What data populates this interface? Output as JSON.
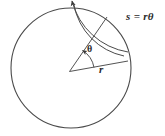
{
  "figure": {
    "kind": "geometry-diagram",
    "background_color": "#ffffff",
    "stroke_color": "#3a3a3a",
    "text_color": "#2b2b2b",
    "labels": {
      "arc_equation": "s = rθ",
      "angle": "θ",
      "radius": "r"
    },
    "geometry": {
      "circle": {
        "center_x": 71,
        "center_y": 68,
        "radius": 60
      },
      "angle_arc": {
        "radius": 20,
        "start_angle_deg": 0,
        "end_angle_deg": 52
      },
      "outer_arc": {
        "radius": 66,
        "start_angle_deg": 52,
        "end_angle_deg": 92
      },
      "radius_lines": [
        {
          "name": "terminal-side",
          "angle_deg": 52
        },
        {
          "name": "initial-side",
          "angle_deg": 0
        }
      ]
    }
  }
}
